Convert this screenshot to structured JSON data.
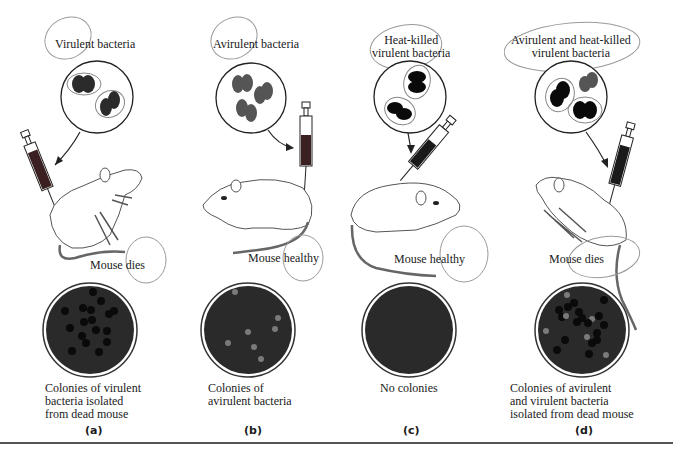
{
  "figure": {
    "panels": [
      {
        "id": "a",
        "label": "(a)",
        "inoculum": "Virulent bacteria",
        "outcome": "Mouse dies",
        "caption": [
          "Colonies of virulent",
          "bacteria isolated",
          "from dead mouse"
        ],
        "plate": "virulent colonies (dark)"
      },
      {
        "id": "b",
        "label": "(b)",
        "inoculum": "Avirulent bacteria",
        "outcome": "Mouse healthy",
        "caption": [
          "Colonies of",
          "avirulent bacteria"
        ],
        "plate": "avirulent colonies (light)"
      },
      {
        "id": "c",
        "label": "(c)",
        "inoculum": [
          "Heat-killed",
          "virulent bacteria"
        ],
        "outcome": "Mouse healthy",
        "caption": [
          "No colonies"
        ],
        "plate": "empty"
      },
      {
        "id": "d",
        "label": "(d)",
        "inoculum": [
          "Avirulent and heat-killed",
          "virulent bacteria"
        ],
        "outcome": "Mouse dies",
        "caption": [
          "Colonies of avirulent",
          "and virulent bacteria",
          "isolated from dead mouse"
        ],
        "plate": "mixed colonies (dark and light)"
      }
    ]
  },
  "colors": {
    "plate_bg": "#2a2a2a",
    "virulent_colony": "#0a0a0a",
    "avirulent_colony": "#7a7a7a",
    "bacteria_virulent": "#2b2b2b",
    "bacteria_avirulent": "#555555",
    "syringe_fluid": "#3a2020",
    "annotation_pencil": "#9a9a9a"
  }
}
